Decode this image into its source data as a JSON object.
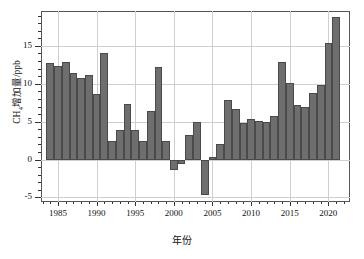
{
  "chart_data": {
    "type": "bar",
    "title": "",
    "subtitle": "",
    "xlabel": "年份",
    "ylabel_prefix": "CH",
    "ylabel_sub": "4",
    "ylabel_suffix": "增加量/ppb",
    "ylabel_full": "CH4增加量/ppb",
    "series_name": "CH4 annual increase",
    "bar_color": "#6e6e6e",
    "bar_edge_color": "#4a4a4a",
    "grid": true,
    "legend": "none",
    "xlim": [
      1982.8,
      1922.0
    ],
    "xlim_actual": [
      1982.8,
      1922.8
    ],
    "ylim": [
      -5.6,
      19.6
    ],
    "yticks": [
      -5,
      0,
      5,
      10,
      15
    ],
    "ytick_labels": [
      "-5",
      "0",
      "5",
      "10",
      "15"
    ],
    "yticks_minor_step": 1,
    "xticks": [
      1985,
      1990,
      1995,
      2000,
      2005,
      2010,
      2015,
      2020
    ],
    "xtick_labels": [
      "1985",
      "1990",
      "1995",
      "2000",
      "2005",
      "2010",
      "2015",
      "2020"
    ],
    "xticks_minor_step": 1,
    "categories": [
      1984,
      1985,
      1986,
      1987,
      1988,
      1989,
      1990,
      1991,
      1992,
      1993,
      1994,
      1995,
      1996,
      1997,
      1998,
      1999,
      2000,
      2001,
      2002,
      2003,
      2004,
      2005,
      2006,
      2007,
      2008,
      2009,
      2010,
      2011,
      2012,
      2013,
      2014,
      2015,
      2016,
      2017,
      2018,
      2019,
      2020,
      2021
    ],
    "values": [
      12.8,
      12.3,
      12.9,
      11.4,
      10.8,
      11.1,
      8.7,
      14.1,
      2.4,
      3.9,
      7.3,
      3.9,
      2.5,
      6.4,
      12.2,
      2.5,
      -1.4,
      -0.6,
      3.3,
      4.9,
      -4.7,
      0.4,
      2.0,
      7.9,
      6.7,
      4.8,
      5.4,
      5.1,
      5.0,
      5.8,
      12.9,
      10.1,
      7.2,
      7.0,
      8.8,
      9.9,
      15.4,
      18.8
    ],
    "units": "ppb"
  }
}
